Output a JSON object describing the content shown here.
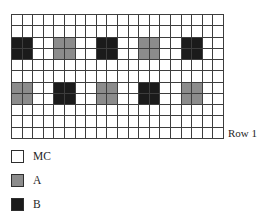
{
  "figure": {
    "row_label": "Row 1"
  },
  "grid": {
    "rows": 11,
    "cols": 20,
    "default_cell": "MC",
    "block_span": {
      "rows": 2,
      "cols": 2
    },
    "blocks": [
      {
        "row": 3,
        "col": 1,
        "type": "B"
      },
      {
        "row": 3,
        "col": 5,
        "type": "A"
      },
      {
        "row": 3,
        "col": 9,
        "type": "B"
      },
      {
        "row": 3,
        "col": 13,
        "type": "A"
      },
      {
        "row": 3,
        "col": 17,
        "type": "B"
      },
      {
        "row": 7,
        "col": 1,
        "type": "A"
      },
      {
        "row": 7,
        "col": 5,
        "type": "B"
      },
      {
        "row": 7,
        "col": 9,
        "type": "A"
      },
      {
        "row": 7,
        "col": 13,
        "type": "B"
      },
      {
        "row": 7,
        "col": 17,
        "type": "A"
      }
    ]
  },
  "legend": {
    "items": [
      {
        "label": "MC",
        "type": "MC"
      },
      {
        "label": "A",
        "type": "A"
      },
      {
        "label": "B",
        "type": "B"
      }
    ]
  },
  "colors": {
    "MC": "#ffffff",
    "A": "#8c8c8c",
    "B": "#1b1b1b",
    "grid_line": "#3d3d3d",
    "background": "#ffffff"
  }
}
